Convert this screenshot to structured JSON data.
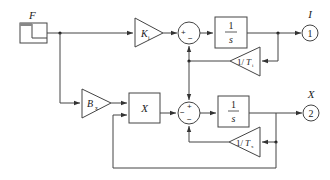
{
  "diagram": {
    "source": {
      "label": "F",
      "type": "step"
    },
    "gains": {
      "ki": {
        "main": "K",
        "sub": "i"
      },
      "bx": {
        "main": "B",
        "sub": "x"
      },
      "inv_ti": {
        "prefix": "1/",
        "main": "T",
        "sub": "i"
      },
      "inv_tx": {
        "prefix": "1/",
        "main": "T",
        "sub": "x"
      }
    },
    "integrators": {
      "top": {
        "num": "1",
        "den": "s"
      },
      "bottom": {
        "num": "1",
        "den": "s"
      }
    },
    "multiplier": {
      "label": "X"
    },
    "sum_top": {
      "signs": [
        "+",
        "−"
      ]
    },
    "sum_bottom": {
      "signs": [
        "+",
        "−",
        "−"
      ]
    },
    "outputs": [
      {
        "label": "I",
        "port": "1"
      },
      {
        "label": "X",
        "port": "2"
      }
    ]
  }
}
